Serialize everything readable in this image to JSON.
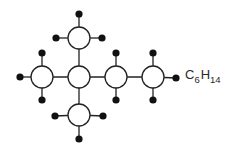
{
  "diagram": {
    "formula": {
      "element1": "C",
      "count1": "6",
      "element2": "H",
      "count2": "14"
    },
    "style": {
      "line_color": "#222222",
      "carbon_fill": "#ffffff",
      "carbon_stroke": "#222222",
      "hydrogen_fill": "#111111",
      "carbon_radius": 11,
      "hydrogen_radius": 3.6,
      "stroke_width": 1.3
    },
    "carbons": [
      {
        "id": "C1",
        "x": 42,
        "y": 77
      },
      {
        "id": "C2",
        "x": 79,
        "y": 77
      },
      {
        "id": "C3",
        "x": 116,
        "y": 77
      },
      {
        "id": "C4",
        "x": 153,
        "y": 77
      },
      {
        "id": "C5",
        "x": 79,
        "y": 38
      },
      {
        "id": "C6",
        "x": 79,
        "y": 115
      }
    ],
    "hydrogens": [
      {
        "id": "H1",
        "x": 20,
        "y": 77,
        "bonded_to": "C1"
      },
      {
        "id": "H2",
        "x": 42,
        "y": 53,
        "bonded_to": "C1"
      },
      {
        "id": "H3",
        "x": 42,
        "y": 100,
        "bonded_to": "C1"
      },
      {
        "id": "H4",
        "x": 79,
        "y": 14,
        "bonded_to": "C5"
      },
      {
        "id": "H5",
        "x": 56,
        "y": 38,
        "bonded_to": "C5"
      },
      {
        "id": "H6",
        "x": 102,
        "y": 38,
        "bonded_to": "C5"
      },
      {
        "id": "H7",
        "x": 55,
        "y": 116,
        "bonded_to": "C6"
      },
      {
        "id": "H8",
        "x": 103,
        "y": 116,
        "bonded_to": "C6"
      },
      {
        "id": "H9",
        "x": 79,
        "y": 139,
        "bonded_to": "C6"
      },
      {
        "id": "H10",
        "x": 116,
        "y": 53,
        "bonded_to": "C3"
      },
      {
        "id": "H11",
        "x": 116,
        "y": 100,
        "bonded_to": "C3"
      },
      {
        "id": "H12",
        "x": 153,
        "y": 53,
        "bonded_to": "C4"
      },
      {
        "id": "H13",
        "x": 153,
        "y": 100,
        "bonded_to": "C4"
      },
      {
        "id": "H14",
        "x": 176,
        "y": 78,
        "bonded_to": "C4"
      }
    ],
    "carbon_bonds": [
      [
        "C1",
        "C2"
      ],
      [
        "C2",
        "C3"
      ],
      [
        "C3",
        "C4"
      ],
      [
        "C2",
        "C5"
      ],
      [
        "C2",
        "C6"
      ]
    ]
  }
}
